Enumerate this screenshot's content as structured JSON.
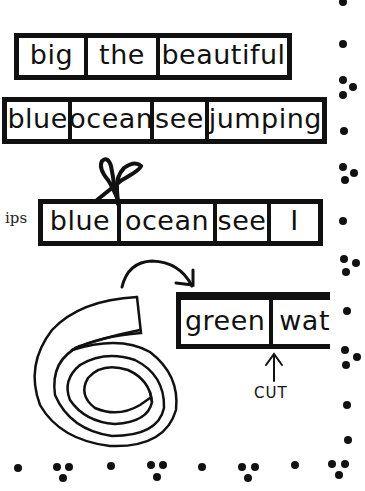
{
  "strips": [
    {
      "id": "strip-1",
      "words": [
        "big",
        "the",
        "beautiful"
      ]
    },
    {
      "id": "strip-2",
      "words": [
        "blue",
        "ocean",
        "see",
        "jumping"
      ]
    },
    {
      "id": "strip-3",
      "words": [
        "blue",
        "ocean",
        "see",
        "I"
      ]
    },
    {
      "id": "strip-4",
      "words": [
        "green",
        "wat"
      ]
    }
  ],
  "side_label": "ips",
  "cut_label": "CUT",
  "colors": {
    "ink": "#111111",
    "background": "#ffffff"
  }
}
